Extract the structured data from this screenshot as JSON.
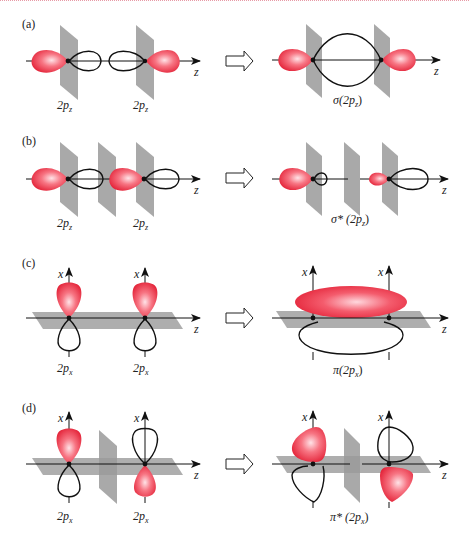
{
  "figure": {
    "colors": {
      "lobe_positive": "#e8303f",
      "lobe_highlight": "#ffd0d6",
      "nodal_plane": "#9a9a9a",
      "axis": "#111111",
      "top_border": "#e79aa6"
    },
    "panels": [
      {
        "id": "a",
        "label": "(a)",
        "axis_label": "z",
        "left_labels": [
          "2p",
          "2p"
        ],
        "left_label_subscripts": [
          "z",
          "z"
        ],
        "result_label": "σ(2p",
        "result_subscript": "z",
        "result_close": ")"
      },
      {
        "id": "b",
        "label": "(b)",
        "axis_label": "z",
        "left_labels": [
          "2p",
          "2p"
        ],
        "left_label_subscripts": [
          "z",
          "z"
        ],
        "result_label": "σ* (2p",
        "result_subscript": "z",
        "result_close": ")"
      },
      {
        "id": "c",
        "label": "(c)",
        "axis_label": "z",
        "vertical_axis_label": "x",
        "left_labels": [
          "2p",
          "2p"
        ],
        "left_label_subscripts": [
          "x",
          "x"
        ],
        "result_label": "π(2p",
        "result_subscript": "x",
        "result_close": ")"
      },
      {
        "id": "d",
        "label": "(d)",
        "axis_label": "z",
        "vertical_axis_label": "x",
        "left_labels": [
          "2p",
          "2p"
        ],
        "left_label_subscripts": [
          "x",
          "x"
        ],
        "result_label": "π* (2p",
        "result_subscript": "x",
        "result_close": ")"
      }
    ],
    "icons": {
      "transition_arrow": "hollow-right-arrow"
    }
  }
}
